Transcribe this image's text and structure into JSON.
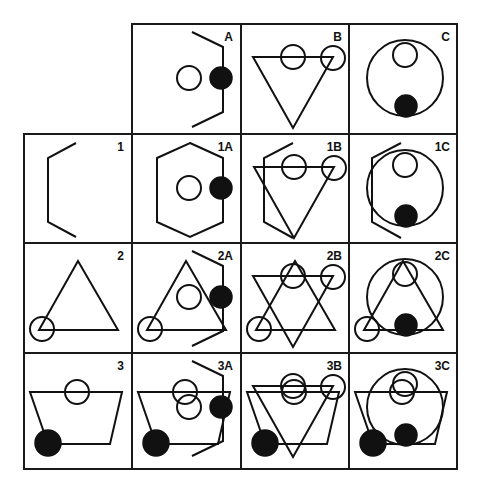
{
  "figure": {
    "type": "matrix-combination-puzzle",
    "columns": [
      "A",
      "B",
      "C"
    ],
    "rows": [
      "1",
      "2",
      "3"
    ],
    "column_headers": [
      {
        "label": "A",
        "description": "right-side hexagon bracket with open circle and filled circle on bracket"
      },
      {
        "label": "B",
        "description": "inverted triangle with two open circles on top edge"
      },
      {
        "label": "C",
        "description": "large circle with small open circle at top and filled circle at bottom"
      }
    ],
    "row_headers": [
      {
        "label": "1",
        "description": "left-side hexagon bracket"
      },
      {
        "label": "2",
        "description": "upright triangle with open circle at bottom-left vertex"
      },
      {
        "label": "3",
        "description": "trapezoid with open circle on top edge and filled circle at bottom-left"
      }
    ],
    "cells": [
      {
        "label": "1A",
        "description": "row 1 + column A combined (full hexagon)"
      },
      {
        "label": "1B",
        "description": "row 1 + column B combined"
      },
      {
        "label": "1C",
        "description": "row 1 + column C combined"
      },
      {
        "label": "2A",
        "description": "row 2 + column A combined"
      },
      {
        "label": "2B",
        "description": "row 2 + column B combined (six-pointed star)"
      },
      {
        "label": "2C",
        "description": "row 2 + column C combined"
      },
      {
        "label": "3A",
        "description": "row 3 + column A combined"
      },
      {
        "label": "3B",
        "description": "row 3 + column B combined"
      },
      {
        "label": "3C",
        "description": "row 3 + column C combined"
      }
    ]
  },
  "colors": {
    "line": "#111111",
    "background": "#ffffff"
  }
}
